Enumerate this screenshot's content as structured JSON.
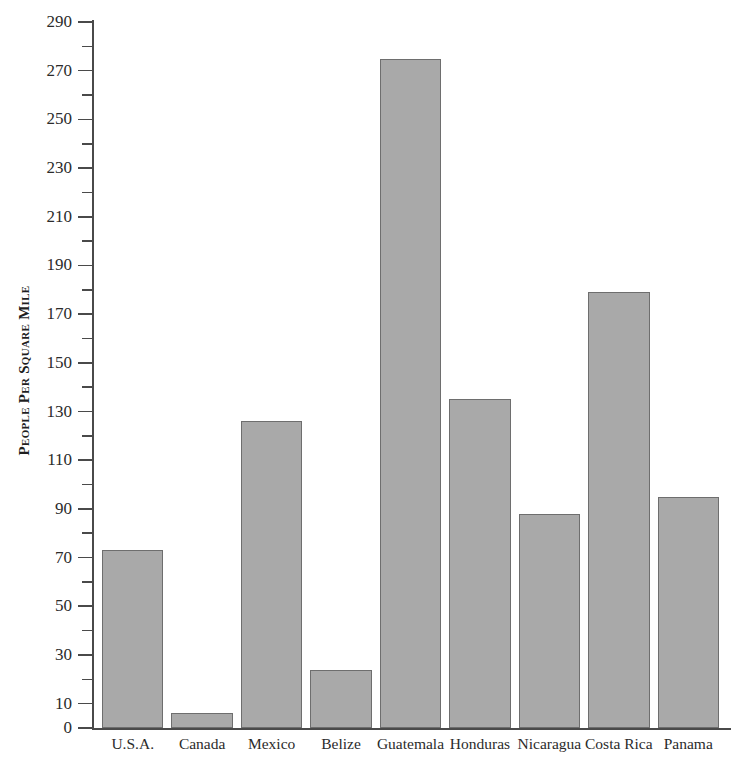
{
  "chart_data": {
    "type": "bar",
    "title": "",
    "xlabel": "",
    "ylabel": "People Per Square Mile",
    "categories": [
      "U.S.A.",
      "Canada",
      "Mexico",
      "Belize",
      "Guatemala",
      "Honduras",
      "Nicaragua",
      "Costa Rica",
      "Panama"
    ],
    "values": [
      73,
      6,
      126,
      24,
      275,
      135,
      88,
      179,
      95
    ],
    "ylim": [
      0,
      290
    ],
    "y_major_ticks": [
      0,
      10,
      30,
      50,
      70,
      90,
      110,
      130,
      150,
      170,
      190,
      210,
      230,
      250,
      270,
      290
    ],
    "y_minor_ticks": [
      20,
      40,
      60,
      80,
      100,
      120,
      140,
      160,
      180,
      200,
      220,
      240,
      260,
      280
    ],
    "y_tick_labels": [
      "0",
      "10",
      "30",
      "50",
      "70",
      "90",
      "110",
      "130",
      "150",
      "170",
      "190",
      "210",
      "230",
      "250",
      "270",
      "290"
    ],
    "grid": false,
    "legend": null,
    "legend_position": "none",
    "bar_fill_color": "#a9a9a9",
    "bar_border_color": "#6e6e6e",
    "axis_color": "#4a4a4a",
    "background_color": "#ffffff"
  }
}
